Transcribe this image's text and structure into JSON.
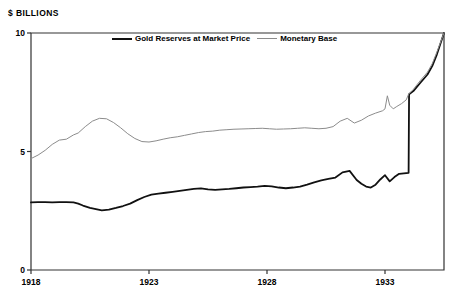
{
  "chart_data": {
    "type": "line",
    "title": "",
    "ylabel": "$ BILLIONS",
    "xlabel": "",
    "ylim": [
      0,
      10
    ],
    "xlim": [
      1918,
      1935.5
    ],
    "yticks": [
      0,
      5,
      10
    ],
    "ytick_labels": [
      "0",
      "5",
      "10"
    ],
    "xticks": [
      1918,
      1923,
      1928,
      1933
    ],
    "xtick_labels": [
      "1918",
      "1923",
      "1928",
      "1933"
    ],
    "grid": false,
    "legend_position": "top-center",
    "colors": {
      "gold_reserves": "#111111",
      "monetary_base": "#8c8c8c",
      "axis": "#333333",
      "background": "#ffffff"
    },
    "series": [
      {
        "name": "Gold Reserves at Market Price",
        "color": "#111111",
        "linewidth": 1.8,
        "x": [
          1918.0,
          1918.3,
          1918.6,
          1918.9,
          1919.2,
          1919.5,
          1919.8,
          1920.0,
          1920.2,
          1920.5,
          1920.8,
          1921.0,
          1921.3,
          1921.6,
          1921.9,
          1922.2,
          1922.5,
          1922.8,
          1923.1,
          1923.4,
          1923.7,
          1924.0,
          1924.3,
          1924.6,
          1924.9,
          1925.2,
          1925.5,
          1925.8,
          1926.1,
          1926.4,
          1926.7,
          1927.0,
          1927.3,
          1927.6,
          1927.9,
          1928.2,
          1928.5,
          1928.8,
          1929.1,
          1929.4,
          1929.7,
          1930.0,
          1930.3,
          1930.6,
          1930.9,
          1931.2,
          1931.5,
          1931.8,
          1932.0,
          1932.2,
          1932.4,
          1932.6,
          1932.8,
          1933.0,
          1933.2,
          1933.4,
          1933.6,
          1933.8,
          1934.0,
          1934.02,
          1934.2,
          1934.5,
          1934.8,
          1935.0,
          1935.2,
          1935.5
        ],
        "values": [
          2.85,
          2.86,
          2.86,
          2.85,
          2.86,
          2.86,
          2.85,
          2.8,
          2.72,
          2.62,
          2.56,
          2.52,
          2.55,
          2.62,
          2.7,
          2.8,
          2.95,
          3.08,
          3.18,
          3.22,
          3.26,
          3.3,
          3.34,
          3.38,
          3.42,
          3.44,
          3.4,
          3.38,
          3.4,
          3.42,
          3.45,
          3.48,
          3.5,
          3.52,
          3.55,
          3.53,
          3.48,
          3.45,
          3.48,
          3.52,
          3.6,
          3.7,
          3.78,
          3.84,
          3.9,
          4.12,
          4.18,
          3.8,
          3.64,
          3.52,
          3.48,
          3.6,
          3.82,
          4.0,
          3.74,
          3.92,
          4.06,
          4.08,
          4.1,
          7.42,
          7.55,
          7.9,
          8.25,
          8.6,
          9.1,
          10.0
        ]
      },
      {
        "name": "Monetary Base",
        "color": "#8c8c8c",
        "linewidth": 1.0,
        "x": [
          1918.0,
          1918.3,
          1918.6,
          1918.9,
          1919.2,
          1919.5,
          1919.8,
          1920.0,
          1920.3,
          1920.6,
          1920.9,
          1921.2,
          1921.5,
          1921.8,
          1922.1,
          1922.4,
          1922.7,
          1923.0,
          1923.3,
          1923.6,
          1923.9,
          1924.2,
          1924.5,
          1924.8,
          1925.1,
          1925.4,
          1925.7,
          1926.0,
          1926.3,
          1926.6,
          1926.9,
          1927.2,
          1927.5,
          1927.8,
          1928.1,
          1928.4,
          1928.7,
          1929.0,
          1929.3,
          1929.6,
          1929.9,
          1930.2,
          1930.5,
          1930.8,
          1931.1,
          1931.4,
          1931.7,
          1932.0,
          1932.3,
          1932.6,
          1932.9,
          1933.0,
          1933.1,
          1933.2,
          1933.35,
          1933.5,
          1933.7,
          1933.9,
          1934.0,
          1934.2,
          1934.5,
          1934.8,
          1935.0,
          1935.2,
          1935.5
        ],
        "values": [
          4.7,
          4.85,
          5.05,
          5.3,
          5.48,
          5.52,
          5.7,
          5.78,
          6.05,
          6.28,
          6.4,
          6.38,
          6.22,
          6.0,
          5.75,
          5.55,
          5.42,
          5.4,
          5.45,
          5.52,
          5.58,
          5.62,
          5.68,
          5.74,
          5.8,
          5.84,
          5.86,
          5.9,
          5.92,
          5.94,
          5.95,
          5.96,
          5.97,
          5.98,
          5.96,
          5.94,
          5.95,
          5.96,
          5.98,
          6.0,
          5.98,
          5.96,
          5.98,
          6.05,
          6.28,
          6.4,
          6.2,
          6.32,
          6.5,
          6.62,
          6.72,
          6.8,
          7.35,
          6.95,
          6.8,
          6.9,
          7.02,
          7.18,
          7.42,
          7.62,
          8.0,
          8.35,
          8.7,
          9.2,
          10.0
        ]
      }
    ]
  },
  "legend": {
    "entries": [
      {
        "label": "Gold Reserves at Market Price",
        "style": "thick"
      },
      {
        "label": "Monetary Base",
        "style": "thin"
      }
    ]
  }
}
